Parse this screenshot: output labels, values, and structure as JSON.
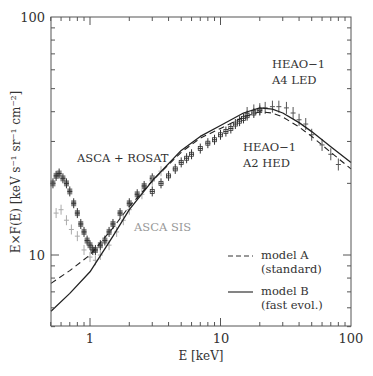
{
  "chart_data": {
    "type": "scatter",
    "title": "",
    "xlabel": "E [keV]",
    "ylabel": "E×F(E) [keV s⁻¹ sr⁻¹ cm⁻²]",
    "xscale": "log",
    "yscale": "log",
    "xlim": [
      0.5,
      100
    ],
    "ylim": [
      5,
      100
    ],
    "x_ticks": [
      1,
      10,
      100
    ],
    "x_tick_labels": [
      "1",
      "10",
      "100"
    ],
    "y_ticks": [
      10,
      100
    ],
    "y_tick_labels": [
      "10",
      "100"
    ],
    "grid": false,
    "legend_position": "lower right",
    "legend": [
      {
        "label": "model A",
        "sublabel": "(standard)",
        "style": "dashed"
      },
      {
        "label": "model B",
        "sublabel": "(fast evol.)",
        "style": "solid"
      }
    ],
    "annotations": [
      {
        "text": "ASCA + ROSAT",
        "color": "#555555"
      },
      {
        "text": "ASCA SIS",
        "color": "#999999"
      },
      {
        "text": "HEAO−1",
        "line2": "A4 LED"
      },
      {
        "text": "HEAO−1",
        "line2": "A2 HED"
      }
    ],
    "series": [
      {
        "name": "model A (standard)",
        "type": "line",
        "style": "dashed",
        "x": [
          0.5,
          0.7,
          1,
          1.5,
          2,
          3,
          5,
          7,
          10,
          15,
          20,
          25,
          30,
          40,
          50,
          70,
          100
        ],
        "y": [
          7.6,
          8.6,
          10.0,
          13.0,
          16.0,
          20.5,
          27.0,
          31.0,
          34.0,
          38.0,
          40.0,
          39.5,
          38.0,
          34.5,
          31.5,
          27.0,
          23.0
        ]
      },
      {
        "name": "model B (fast evol.)",
        "type": "line",
        "style": "solid",
        "x": [
          0.5,
          0.7,
          1,
          1.5,
          2,
          3,
          5,
          7,
          10,
          15,
          20,
          25,
          30,
          40,
          50,
          70,
          100
        ],
        "y": [
          5.8,
          6.9,
          8.5,
          12.0,
          15.5,
          20.5,
          27.5,
          31.5,
          35.0,
          39.5,
          41.5,
          41.0,
          39.5,
          36.0,
          33.0,
          28.5,
          24.5
        ]
      },
      {
        "name": "ASCA + ROSAT",
        "type": "scatter",
        "x": [
          0.52,
          0.55,
          0.58,
          0.62,
          0.66,
          0.7,
          0.75,
          0.8,
          0.85,
          0.9,
          0.95,
          1.0,
          1.05,
          1.1,
          1.2,
          1.3,
          1.4,
          1.5,
          1.7,
          2.0,
          2.3,
          2.6,
          3.0
        ],
        "y": [
          20.0,
          21.5,
          22.0,
          21.0,
          20.0,
          18.5,
          16.5,
          15.0,
          13.5,
          12.5,
          11.5,
          11.0,
          10.5,
          10.5,
          11.0,
          11.5,
          12.5,
          13.5,
          15.0,
          16.5,
          18.0,
          19.5,
          21.0
        ]
      },
      {
        "name": "ASCA SIS",
        "type": "scatter",
        "x": [
          0.55,
          0.6,
          0.66,
          0.72,
          0.8,
          0.9,
          1.0,
          1.1,
          1.2,
          1.4,
          1.6,
          1.8,
          2.0,
          2.5,
          3.0,
          3.5
        ],
        "y": [
          15.0,
          15.5,
          14.0,
          12.8,
          12.0,
          10.5,
          9.8,
          9.5,
          10.0,
          11.0,
          12.5,
          14.0,
          15.5,
          18.0,
          20.5,
          22.5
        ]
      },
      {
        "name": "HEAO-1 A2 HED",
        "type": "scatter",
        "x": [
          3,
          3.5,
          4,
          4.5,
          5,
          5.5,
          6,
          7,
          8,
          9,
          10,
          11,
          12,
          13,
          14,
          15,
          16,
          18,
          20
        ],
        "y": [
          18.5,
          20.0,
          21.5,
          23.0,
          24.5,
          25.5,
          26.5,
          28.0,
          29.5,
          30.5,
          32.0,
          33.0,
          34.0,
          35.5,
          36.5,
          37.5,
          38.5,
          39.5,
          40.5
        ]
      },
      {
        "name": "HEAO-1 A4 LED",
        "type": "scatter",
        "x": [
          16,
          18,
          20,
          22,
          25,
          28,
          32,
          36,
          40,
          45,
          50,
          60,
          70,
          80
        ],
        "y": [
          39.5,
          40.5,
          41.0,
          41.5,
          42.0,
          42.0,
          41.5,
          39.5,
          37.0,
          35.5,
          32.0,
          29.0,
          26.5,
          24.0
        ]
      }
    ]
  },
  "caption": {
    "text": ""
  }
}
